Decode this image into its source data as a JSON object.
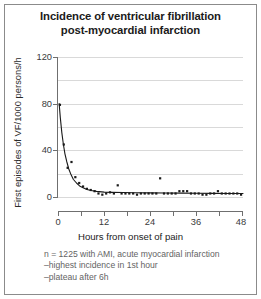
{
  "figure": {
    "title_line1": "Incidence of ventricular fibrillation",
    "title_line2": "post-myocardial infarction"
  },
  "notes": [
    "n = 1225 with AMI, acute myocardial infarction",
    "–highest incidence in 1st hour",
    "–plateau after 6h"
  ],
  "chart_data": {
    "type": "scatter",
    "title": "Incidence of ventricular fibrillation post-myocardial infarction",
    "xlabel": "Hours from onset of pain",
    "ylabel": "First episodes of VF/1000 persons/h",
    "xlim": [
      0,
      48
    ],
    "ylim": [
      0,
      120
    ],
    "xticks": [
      0,
      12,
      24,
      36,
      48
    ],
    "xticks_minor": [
      6,
      18,
      30,
      42
    ],
    "yticks": [
      0,
      40,
      80,
      120
    ],
    "ygrid_values": [
      0,
      20,
      40,
      60,
      80,
      100,
      120
    ],
    "grid": true,
    "legend": "none",
    "series": [
      {
        "name": "First episodes of VF per 1000 persons per hour",
        "marker": "square",
        "x": [
          0.5,
          1.5,
          2.5,
          3.5,
          4.5,
          5.5,
          6.5,
          7.5,
          8.5,
          9.5,
          10.5,
          11.5,
          12.5,
          13.5,
          14.5,
          15.5,
          16.5,
          17.5,
          18.5,
          19.5,
          20.5,
          21.5,
          22.5,
          23.5,
          24.5,
          25.5,
          26.5,
          27.5,
          28.5,
          29.5,
          30.5,
          31.5,
          32.5,
          33.5,
          34.5,
          35.5,
          36.5,
          37.5,
          38.5,
          39.5,
          40.5,
          41.5,
          42.5,
          43.5,
          44.5,
          45.5,
          46.5,
          47.5
        ],
        "y": [
          79,
          45,
          25,
          30,
          17,
          12,
          9,
          7,
          6,
          5,
          3,
          2,
          3,
          4,
          3,
          10,
          3,
          3,
          3,
          3,
          2,
          3,
          3,
          3,
          3,
          3,
          16,
          3,
          3,
          3,
          3,
          5,
          5,
          5,
          3,
          3,
          3,
          2,
          2,
          3,
          3,
          5,
          3,
          3,
          3,
          3,
          3,
          2
        ]
      }
    ],
    "fit_curve": {
      "name": "exponential decay fit",
      "x": [
        0.3,
        0.6,
        1.0,
        1.4,
        1.8,
        2.3,
        2.8,
        3.4,
        4.0,
        4.8,
        5.6,
        6.5,
        7.5,
        8.6,
        10.0,
        12.0,
        14.0,
        17.0,
        20.0,
        24.0,
        28.0,
        32.0,
        36.0,
        40.0,
        44.0,
        48.0
      ],
      "y": [
        80,
        68,
        55,
        45,
        37,
        30,
        24,
        19,
        15,
        12,
        9.5,
        8,
        6.5,
        5.5,
        4.8,
        4.2,
        4.0,
        3.8,
        3.6,
        3.5,
        3.4,
        3.3,
        3.2,
        3.1,
        3.0,
        3.0
      ]
    }
  },
  "axis_labels": {
    "y": [
      "120",
      "80",
      "40",
      "0"
    ],
    "x": [
      "0",
      "12",
      "24",
      "36",
      "48"
    ]
  }
}
